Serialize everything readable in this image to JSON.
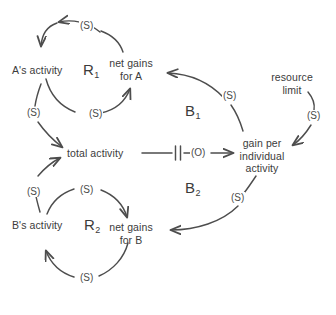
{
  "diagram": {
    "type": "causal-loop-diagram",
    "title": "",
    "stroke_color": "#4d4d4d",
    "text_color": "#3b3b3b",
    "background_color": "#ffffff",
    "nodes": [
      {
        "id": "a_activity",
        "label": "A's activity"
      },
      {
        "id": "net_gains_a",
        "label_line1": "net gains",
        "label_line2": "for A"
      },
      {
        "id": "total_activity",
        "label": "total activity"
      },
      {
        "id": "gain_per_individual",
        "label_line1": "gain per",
        "label_line2": "individual",
        "label_line3": "activity"
      },
      {
        "id": "resource_limit",
        "label_line1": "resource",
        "label_line2": "limit"
      },
      {
        "id": "b_activity",
        "label": "B's activity"
      },
      {
        "id": "net_gains_b",
        "label_line1": "net gains",
        "label_line2": "for B"
      }
    ],
    "loops": [
      {
        "id": "R1",
        "letter": "R",
        "subscript": "1",
        "kind": "reinforcing"
      },
      {
        "id": "B1",
        "letter": "B",
        "subscript": "1",
        "kind": "balancing"
      },
      {
        "id": "B2",
        "letter": "B",
        "subscript": "2",
        "kind": "balancing"
      },
      {
        "id": "R2",
        "letter": "R",
        "subscript": "2",
        "kind": "reinforcing"
      }
    ],
    "links": [
      {
        "id": "l1",
        "from": "net_gains_a",
        "to": "a_activity",
        "polarity": "(S)"
      },
      {
        "id": "l2",
        "from": "a_activity",
        "to": "net_gains_a",
        "polarity": "(S)"
      },
      {
        "id": "l3",
        "from": "a_activity",
        "to": "total_activity",
        "polarity": "(S)"
      },
      {
        "id": "l4",
        "from": "total_activity",
        "to": "gain_per_individual",
        "polarity": "(O)",
        "delay": true
      },
      {
        "id": "l5",
        "from": "gain_per_individual",
        "to": "net_gains_a",
        "polarity": "(S)"
      },
      {
        "id": "l6",
        "from": "resource_limit",
        "to": "gain_per_individual",
        "polarity": "(S)"
      },
      {
        "id": "l7",
        "from": "gain_per_individual",
        "to": "net_gains_b",
        "polarity": "(S)"
      },
      {
        "id": "l8",
        "from": "b_activity",
        "to": "net_gains_b",
        "polarity": "(S)"
      },
      {
        "id": "l9",
        "from": "net_gains_b",
        "to": "b_activity",
        "polarity": "(S)"
      },
      {
        "id": "l10",
        "from": "b_activity",
        "to": "total_activity",
        "polarity": "(S)"
      }
    ],
    "polarity_labels": {
      "top_r1": "(S)",
      "r1_bottom_right": "(S)",
      "a_to_total": "(S)",
      "total_to_gain": "(O)",
      "gain_to_net_a": "(S)",
      "resource_to_gain": "(S)",
      "gain_to_net_b": "(S)",
      "b_top": "(S)",
      "b_to_total": "(S)",
      "r2_bottom": "(S)"
    }
  }
}
